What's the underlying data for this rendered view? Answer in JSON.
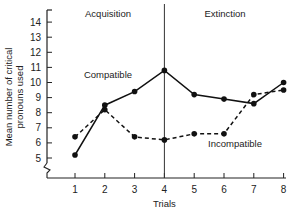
{
  "chart_data": {
    "type": "line",
    "title": "",
    "xlabel": "Trials",
    "ylabel": "Mean number of critical pronouns used",
    "x": [
      1,
      2,
      3,
      4,
      5,
      6,
      7,
      8
    ],
    "xticks": [
      "1",
      "2",
      "3",
      "4",
      "5",
      "6",
      "7",
      "8"
    ],
    "yticks": [
      "5",
      "6",
      "7",
      "8",
      "9",
      "10",
      "11",
      "12",
      "13",
      "14"
    ],
    "ylim": [
      4,
      14.7
    ],
    "grid": false,
    "axis_break": true,
    "phases": [
      {
        "label": "Acquisition",
        "trials": [
          1,
          4
        ]
      },
      {
        "label": "Extinction",
        "trials": [
          4,
          8
        ]
      }
    ],
    "divider_at_trial": 4,
    "series": [
      {
        "name": "Compatible",
        "style": "solid",
        "values": [
          5.2,
          8.5,
          9.4,
          10.8,
          9.2,
          8.9,
          8.6,
          10.0
        ]
      },
      {
        "name": "Incompatible",
        "style": "dashed",
        "values": [
          6.4,
          8.2,
          6.4,
          6.2,
          6.6,
          6.6,
          9.2,
          9.5
        ]
      }
    ]
  }
}
